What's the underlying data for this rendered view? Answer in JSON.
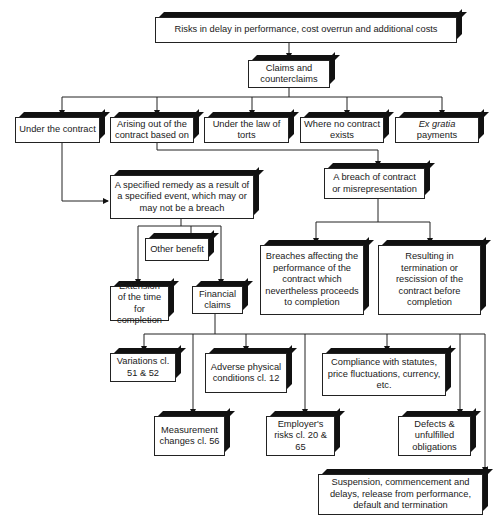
{
  "diagram": {
    "type": "flowchart",
    "root": "Risks in delay in performance, cost overrun and additional costs",
    "claims": "Claims and counterclaims",
    "bases": [
      "Under the contract",
      "Arising out of the contract based on",
      "Under the law of torts",
      "Where no contract exists",
      "Ex gratia payments"
    ],
    "specified_remedy": "A specified remedy as a result of a specified event, which may or may not be a breach",
    "breach": "A breach of contract or misrepresentation",
    "other_benefit": "Other benefit",
    "extension": "Extension of the time for completion",
    "financial": "Financial claims",
    "breaches_affecting": "Breaches affecting the performance of the contract which nevertheless proceeds to completion",
    "resulting_termination": "Resulting in termination or rescission of the contract before completion",
    "financial_items": {
      "variations": "Variations cl. 51 & 52",
      "adverse": "Adverse physical conditions cl. 12",
      "compliance": "Compliance with statutes, price fluctuations, currency, etc.",
      "measurement": "Measurement changes cl. 56",
      "employers_risks": "Employer's risks cl. 20 & 65",
      "defects": "Defects & unfulfilled obligations",
      "suspension": "Suspension, commencement and delays, release from performance, default and termination"
    }
  }
}
